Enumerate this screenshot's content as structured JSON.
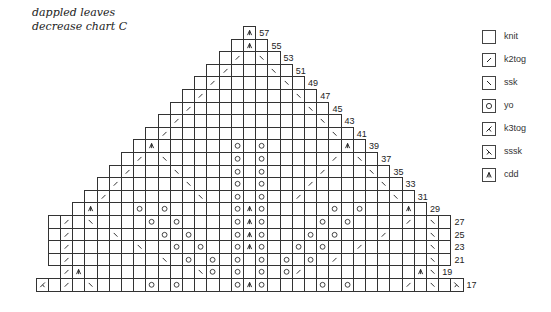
{
  "title": {
    "line1": "dappled leaves",
    "line2": "decrease chart C"
  },
  "legend": [
    {
      "key": "knit",
      "label": "knit"
    },
    {
      "key": "k2tog",
      "label": "k2tog"
    },
    {
      "key": "ssk",
      "label": "ssk"
    },
    {
      "key": "yo",
      "label": "yo"
    },
    {
      "key": "k3tog",
      "label": "k3tog"
    },
    {
      "key": "sssk",
      "label": "sssk"
    },
    {
      "key": "cdd",
      "label": "cdd"
    }
  ],
  "chart_data": {
    "type": "knitting-chart",
    "title": "dappled leaves decrease chart C",
    "row_label_side": "right",
    "columns_note": "col offsets relative to center column (0); cells listed are non-knit stitches",
    "rows": [
      {
        "row": 57,
        "from": 0,
        "to": 0,
        "stitches": {
          "0": "cdd"
        }
      },
      {
        "row": 55,
        "from": -1,
        "to": 1,
        "stitches": {
          "0": "cdd"
        }
      },
      {
        "row": 53,
        "from": -2,
        "to": 2,
        "stitches": {
          "-1": "k2tog",
          "1": "ssk"
        }
      },
      {
        "row": 51,
        "from": -3,
        "to": 3,
        "stitches": {
          "-2": "k2tog",
          "2": "ssk"
        }
      },
      {
        "row": 49,
        "from": -4,
        "to": 4,
        "stitches": {
          "-3": "k2tog",
          "3": "ssk"
        }
      },
      {
        "row": 47,
        "from": -5,
        "to": 5,
        "stitches": {
          "-4": "k2tog",
          "4": "ssk"
        }
      },
      {
        "row": 45,
        "from": -6,
        "to": 6,
        "stitches": {
          "-5": "k2tog",
          "5": "ssk"
        }
      },
      {
        "row": 43,
        "from": -7,
        "to": 7,
        "stitches": {
          "-6": "k2tog",
          "6": "ssk"
        }
      },
      {
        "row": 41,
        "from": -8,
        "to": 8,
        "stitches": {
          "-7": "k2tog",
          "7": "ssk"
        }
      },
      {
        "row": 39,
        "from": -9,
        "to": 9,
        "stitches": {
          "-8": "cdd",
          "-1": "yo",
          "1": "yo",
          "8": "cdd"
        }
      },
      {
        "row": 37,
        "from": -10,
        "to": 10,
        "stitches": {
          "-9": "k2tog",
          "-7": "ssk",
          "-1": "yo",
          "1": "yo",
          "7": "k2tog",
          "9": "ssk"
        }
      },
      {
        "row": 35,
        "from": -11,
        "to": 11,
        "stitches": {
          "-10": "k2tog",
          "-6": "ssk",
          "-1": "yo",
          "1": "yo",
          "6": "k2tog",
          "10": "ssk"
        }
      },
      {
        "row": 33,
        "from": -12,
        "to": 12,
        "stitches": {
          "-11": "k2tog",
          "-5": "ssk",
          "-1": "yo",
          "1": "yo",
          "5": "k2tog",
          "11": "ssk"
        }
      },
      {
        "row": 31,
        "from": -13,
        "to": 13,
        "stitches": {
          "-12": "k2tog",
          "-4": "ssk",
          "-1": "yo",
          "1": "yo",
          "4": "k2tog",
          "12": "ssk"
        }
      },
      {
        "row": 29,
        "from": -14,
        "to": 14,
        "stitches": {
          "-13": "cdd",
          "-9": "yo",
          "-7": "yo",
          "-1": "yo",
          "0": "cdd",
          "1": "yo",
          "7": "yo",
          "9": "yo",
          "13": "cdd"
        }
      },
      {
        "row": 27,
        "from": -16,
        "to": 16,
        "stitches": {
          "-15": "k2tog",
          "-13": "ssk",
          "-8": "yo",
          "-6": "yo",
          "-1": "yo",
          "0": "cdd",
          "1": "yo",
          "6": "yo",
          "8": "yo",
          "13": "k2tog",
          "15": "ssk"
        }
      },
      {
        "row": 25,
        "from": -16,
        "to": 16,
        "stitches": {
          "-15": "k2tog",
          "-11": "ssk",
          "-7": "yo",
          "-5": "yo",
          "-1": "yo",
          "0": "cdd",
          "1": "yo",
          "5": "yo",
          "7": "yo",
          "11": "k2tog",
          "15": "ssk"
        }
      },
      {
        "row": 23,
        "from": -16,
        "to": 16,
        "stitches": {
          "-15": "k2tog",
          "-9": "ssk",
          "-6": "yo",
          "-4": "yo",
          "-1": "yo",
          "0": "cdd",
          "1": "yo",
          "4": "yo",
          "6": "yo",
          "9": "k2tog",
          "15": "ssk"
        }
      },
      {
        "row": 21,
        "from": -16,
        "to": 16,
        "stitches": {
          "-15": "k2tog",
          "-7": "ssk",
          "-5": "yo",
          "-3": "yo",
          "-1": "yo",
          "1": "yo",
          "3": "yo",
          "5": "yo",
          "7": "k2tog",
          "15": "ssk"
        }
      },
      {
        "row": 19,
        "from": -15,
        "to": 15,
        "stitches": {
          "-15": "k2tog",
          "-14": "cdd",
          "-4": "ssk",
          "-3": "yo",
          "-1": "yo",
          "1": "yo",
          "3": "yo",
          "4": "k2tog",
          "14": "cdd",
          "15": "ssk"
        }
      },
      {
        "row": 17,
        "from": -17,
        "to": 17,
        "stitches": {
          "-17": "k3tog",
          "-15": "k2tog",
          "-13": "ssk",
          "-8": "yo",
          "-6": "yo",
          "-1": "yo",
          "0": "cdd",
          "1": "yo",
          "6": "yo",
          "8": "yo",
          "13": "k2tog",
          "15": "ssk",
          "17": "sssk"
        }
      }
    ]
  }
}
